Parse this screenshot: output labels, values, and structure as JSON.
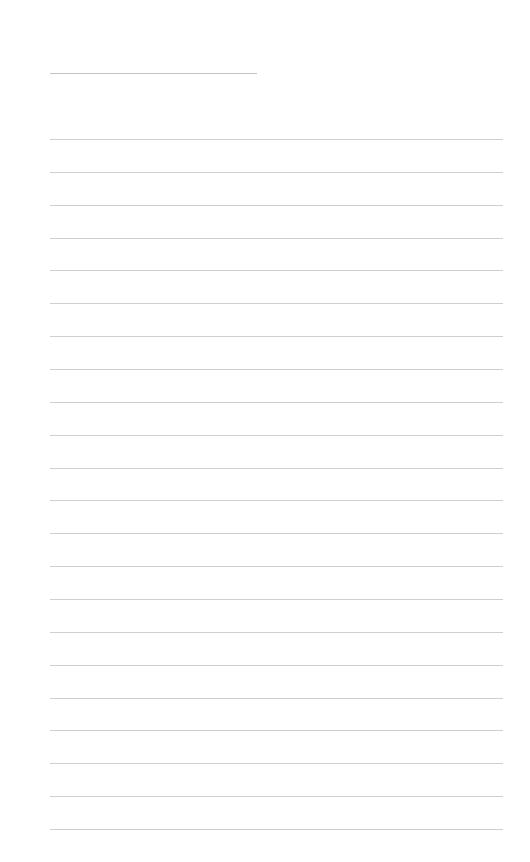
{
  "page": {
    "type": "lined-paper",
    "background_color": "#ffffff",
    "line_color": "#cfcfcf",
    "title_line": {
      "x": 50,
      "y": 73,
      "width": 207
    },
    "ruled_lines": {
      "count": 22,
      "start_y": 139,
      "end_y": 829,
      "x": 50,
      "width": 453
    }
  }
}
